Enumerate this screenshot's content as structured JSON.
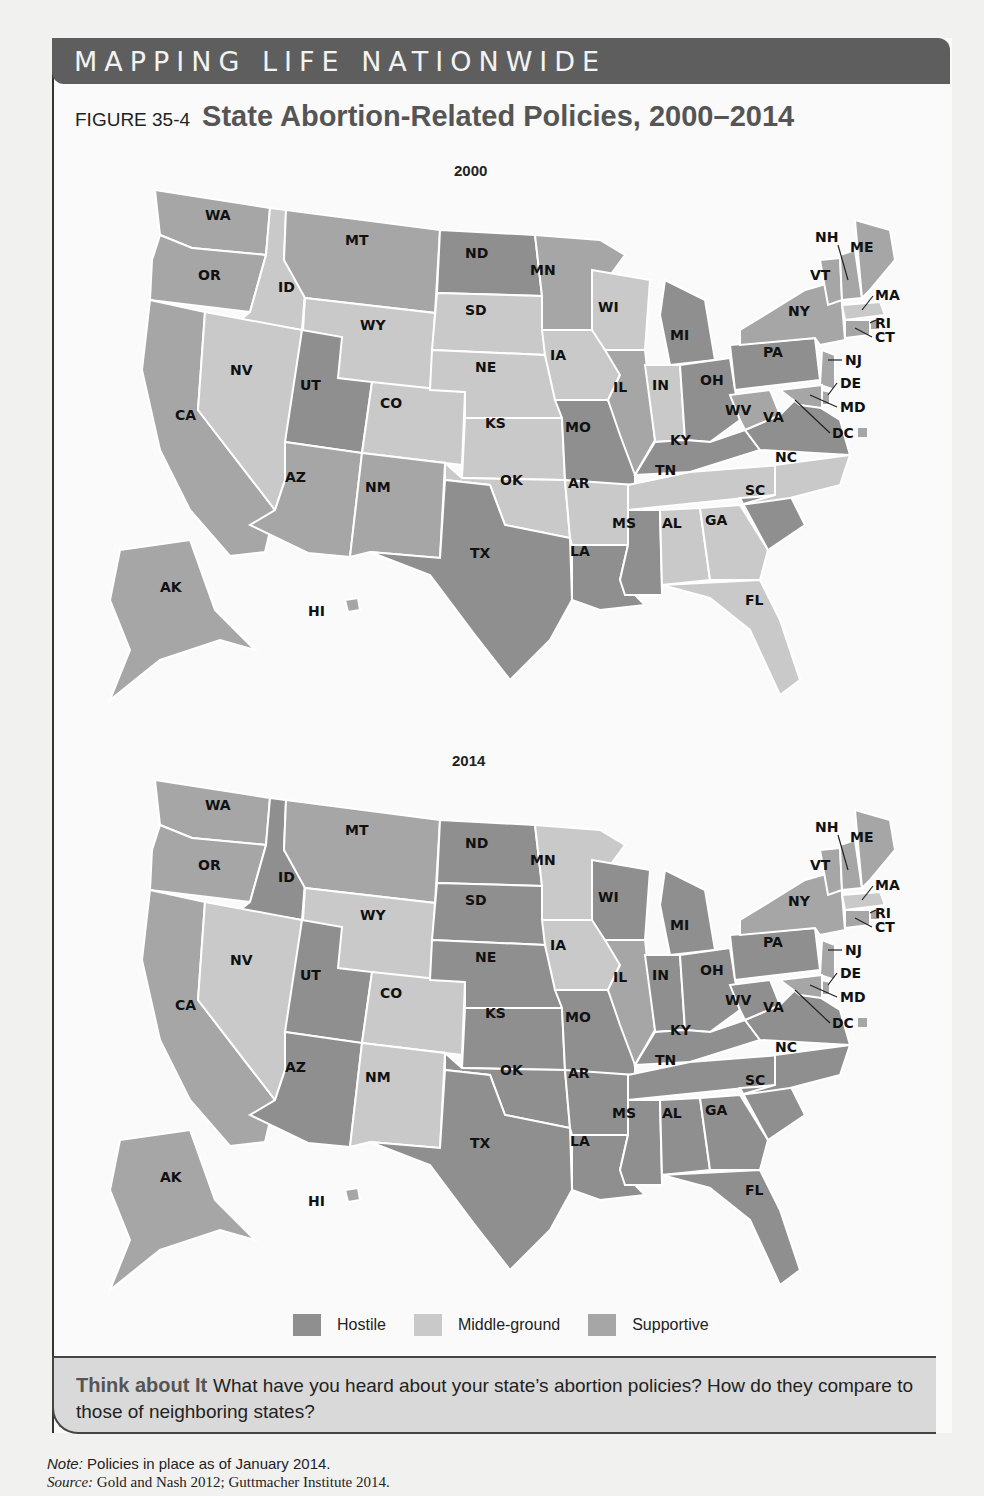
{
  "banner": {
    "title": "MAPPING LIFE NATIONWIDE"
  },
  "figure": {
    "number": "FIGURE 35-4",
    "title": "State Abortion-Related Policies, 2000–2014"
  },
  "colors": {
    "hostile": "#8f8f8f",
    "middle_ground": "#c9c9c9",
    "supportive": "#a6a6a6"
  },
  "legend": [
    {
      "key": "hostile",
      "label": "Hostile"
    },
    {
      "key": "middle_ground",
      "label": "Middle-ground"
    },
    {
      "key": "supportive",
      "label": "Supportive"
    }
  ],
  "maps": [
    {
      "year": "2000"
    },
    {
      "year": "2014"
    }
  ],
  "think": {
    "heading": "Think about It",
    "text": "What have you heard about your state’s abortion policies? How do they compare to those of neighboring states?"
  },
  "note": {
    "label": "Note:",
    "text": "Policies in place as of January 2014."
  },
  "source": {
    "label": "Source:",
    "text": "Gold and Nash 2012; Guttmacher Institute 2014."
  },
  "chart_data": {
    "type": "table",
    "title": "State Abortion-Related Policies, 2000–2014",
    "legend": [
      "Hostile",
      "Middle-ground",
      "Supportive"
    ],
    "columns": [
      "state",
      "2000",
      "2014"
    ],
    "rows": [
      [
        "WA",
        "Supportive",
        "Supportive"
      ],
      [
        "OR",
        "Supportive",
        "Supportive"
      ],
      [
        "CA",
        "Supportive",
        "Supportive"
      ],
      [
        "ID",
        "Middle-ground",
        "Hostile"
      ],
      [
        "NV",
        "Middle-ground",
        "Middle-ground"
      ],
      [
        "MT",
        "Supportive",
        "Supportive"
      ],
      [
        "WY",
        "Middle-ground",
        "Middle-ground"
      ],
      [
        "UT",
        "Hostile",
        "Hostile"
      ],
      [
        "CO",
        "Middle-ground",
        "Middle-ground"
      ],
      [
        "AZ",
        "Supportive",
        "Hostile"
      ],
      [
        "NM",
        "Supportive",
        "Middle-ground"
      ],
      [
        "ND",
        "Hostile",
        "Hostile"
      ],
      [
        "SD",
        "Middle-ground",
        "Hostile"
      ],
      [
        "NE",
        "Middle-ground",
        "Hostile"
      ],
      [
        "KS",
        "Middle-ground",
        "Hostile"
      ],
      [
        "OK",
        "Middle-ground",
        "Hostile"
      ],
      [
        "TX",
        "Hostile",
        "Hostile"
      ],
      [
        "MN",
        "Supportive",
        "Middle-ground"
      ],
      [
        "IA",
        "Middle-ground",
        "Middle-ground"
      ],
      [
        "MO",
        "Hostile",
        "Hostile"
      ],
      [
        "AR",
        "Middle-ground",
        "Hostile"
      ],
      [
        "LA",
        "Hostile",
        "Hostile"
      ],
      [
        "WI",
        "Middle-ground",
        "Hostile"
      ],
      [
        "IL",
        "Supportive",
        "Supportive"
      ],
      [
        "MI",
        "Hostile",
        "Hostile"
      ],
      [
        "IN",
        "Middle-ground",
        "Hostile"
      ],
      [
        "OH",
        "Hostile",
        "Hostile"
      ],
      [
        "KY",
        "Hostile",
        "Hostile"
      ],
      [
        "TN",
        "Middle-ground",
        "Hostile"
      ],
      [
        "MS",
        "Hostile",
        "Hostile"
      ],
      [
        "AL",
        "Middle-ground",
        "Hostile"
      ],
      [
        "GA",
        "Middle-ground",
        "Hostile"
      ],
      [
        "FL",
        "Middle-ground",
        "Hostile"
      ],
      [
        "SC",
        "Hostile",
        "Hostile"
      ],
      [
        "NC",
        "Middle-ground",
        "Hostile"
      ],
      [
        "VA",
        "Hostile",
        "Hostile"
      ],
      [
        "WV",
        "Supportive",
        "Hostile"
      ],
      [
        "PA",
        "Hostile",
        "Hostile"
      ],
      [
        "NY",
        "Supportive",
        "Supportive"
      ],
      [
        "VT",
        "Supportive",
        "Supportive"
      ],
      [
        "NH",
        "Supportive",
        "Supportive"
      ],
      [
        "ME",
        "Supportive",
        "Supportive"
      ],
      [
        "MA",
        "Middle-ground",
        "Middle-ground"
      ],
      [
        "RI",
        "Supportive",
        "Supportive"
      ],
      [
        "CT",
        "Supportive",
        "Supportive"
      ],
      [
        "NJ",
        "Supportive",
        "Supportive"
      ],
      [
        "DE",
        "Supportive",
        "Supportive"
      ],
      [
        "MD",
        "Supportive",
        "Supportive"
      ],
      [
        "DC",
        "Supportive",
        "Supportive"
      ],
      [
        "AK",
        "Supportive",
        "Supportive"
      ],
      [
        "HI",
        "Supportive",
        "Supportive"
      ]
    ]
  }
}
